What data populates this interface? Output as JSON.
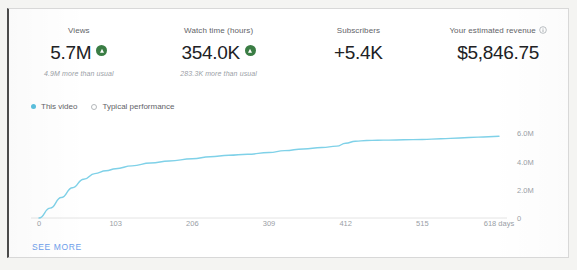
{
  "metrics": [
    {
      "label": "Views",
      "value": "5.7M",
      "trend": "up",
      "sub": "4.9M more than usual"
    },
    {
      "label": "Watch time (hours)",
      "value": "354.0K",
      "trend": "up",
      "sub": "283.3K more than usual"
    },
    {
      "label": "Subscribers",
      "value": "+5.4K",
      "trend": "none",
      "sub": ""
    },
    {
      "label": "Your estimated revenue",
      "value": "$5,846.75",
      "trend": "none",
      "sub": "",
      "info_icon": "info-icon"
    }
  ],
  "legend": [
    {
      "label": "This video",
      "color": "#5bc0de",
      "style": "filled"
    },
    {
      "label": "Typical performance",
      "color": "#b4b8bb",
      "style": "hollow"
    }
  ],
  "footer": {
    "see_more": "SEE MORE"
  },
  "colors": {
    "line": "#7fd1e8",
    "accent_green": "#3a7d44",
    "link_blue": "#6d9eeb",
    "text_primary": "#202124",
    "text_muted": "#9aa0a6"
  },
  "chart_data": {
    "type": "line",
    "title": "",
    "xlabel": "days",
    "ylabel": "",
    "grid": false,
    "legend_position": "top-left",
    "xlim": [
      0,
      618
    ],
    "ylim": [
      0,
      6600000
    ],
    "xticks": [
      0,
      103,
      206,
      309,
      412,
      515,
      618
    ],
    "xticklabels": [
      "0",
      "103",
      "206",
      "309",
      "412",
      "515",
      "618 days"
    ],
    "yticks": [
      0,
      2000000,
      4000000,
      6000000
    ],
    "yticklabels": [
      "0",
      "2.0M",
      "4.0M",
      "6.0M"
    ],
    "series": [
      {
        "name": "This video",
        "color": "#7fd1e8",
        "x": [
          0,
          15,
          30,
          45,
          60,
          75,
          90,
          103,
          125,
          150,
          175,
          206,
          230,
          255,
          280,
          309,
          330,
          355,
          380,
          400,
          412,
          425,
          440,
          455,
          470,
          490,
          515,
          540,
          565,
          590,
          618
        ],
        "y": [
          0,
          700000,
          1450000,
          2150000,
          2750000,
          3150000,
          3350000,
          3500000,
          3700000,
          3900000,
          4050000,
          4200000,
          4350000,
          4450000,
          4520000,
          4650000,
          4780000,
          4900000,
          5000000,
          5100000,
          5300000,
          5450000,
          5500000,
          5520000,
          5530000,
          5550000,
          5570000,
          5620000,
          5680000,
          5740000,
          5800000
        ]
      }
    ]
  }
}
